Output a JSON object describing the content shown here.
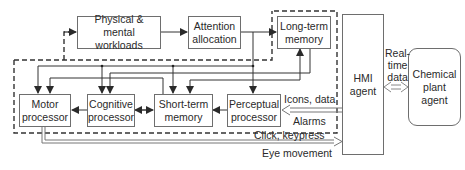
{
  "diagram": {
    "boxes": {
      "workloads": "Physical & mental\nworkloads",
      "attention": "Attention\nallocation",
      "ltm": "Long-term\nmemory",
      "motor": "Motor\nprocessor",
      "cognitive": "Cognitive\nprocessor",
      "stm": "Short-term\nmemory",
      "perceptual": "Perceptual\nprocessor",
      "hmi": "HMI\nagent",
      "plant": "Chemical\nplant\nagent"
    },
    "edge_labels": {
      "realtime": "Real-\ntime\ndata",
      "icons": "Icons, data",
      "alarms": "Alarms",
      "click": "Click, keypress",
      "eye": "Eye movement"
    },
    "colors": {
      "line": "#3a3a3a",
      "box_border": "#6e6e6e",
      "double_arrow": "#8a8a8a"
    }
  }
}
